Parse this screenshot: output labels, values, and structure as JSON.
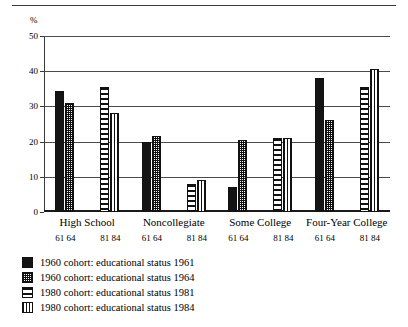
{
  "figure": {
    "y_unit": "%"
  },
  "chart_data": {
    "type": "bar",
    "title": "",
    "xlabel": "",
    "ylabel": "%",
    "ylim": [
      0,
      50
    ],
    "yticks": [
      0,
      10,
      20,
      30,
      40,
      50
    ],
    "grid": true,
    "legend_position": "below",
    "categories": [
      "High School",
      "Noncollegiate",
      "Some College",
      "Four-Year College"
    ],
    "group_sublabels": [
      [
        "61",
        "64"
      ],
      [
        "81",
        "84"
      ]
    ],
    "series": [
      {
        "name": "1960 cohort: educational status 1961",
        "pattern": "solid",
        "values": [
          34.5,
          20.0,
          7.0,
          38.0
        ]
      },
      {
        "name": "1960 cohort: educational status 1964",
        "pattern": "stipple",
        "values": [
          31.0,
          21.5,
          20.5,
          26.0
        ]
      },
      {
        "name": "1980 cohort: educational status 1981",
        "pattern": "horizontal-stripe",
        "values": [
          35.5,
          8.0,
          21.0,
          35.5
        ]
      },
      {
        "name": "1980 cohort: educational status 1984",
        "pattern": "vertical-stripe",
        "values": [
          28.0,
          9.0,
          21.0,
          40.5
        ]
      }
    ]
  },
  "axis": {
    "tick_labels": [
      "50",
      "40",
      "30",
      "20",
      "10",
      "0"
    ]
  },
  "legend": {
    "items": [
      {
        "label": "1960 cohort: educational status 1961"
      },
      {
        "label": "1960 cohort: educational status 1964"
      },
      {
        "label": "1980 cohort: educational status 1981"
      },
      {
        "label": "1980 cohort: educational status 1984"
      }
    ]
  }
}
